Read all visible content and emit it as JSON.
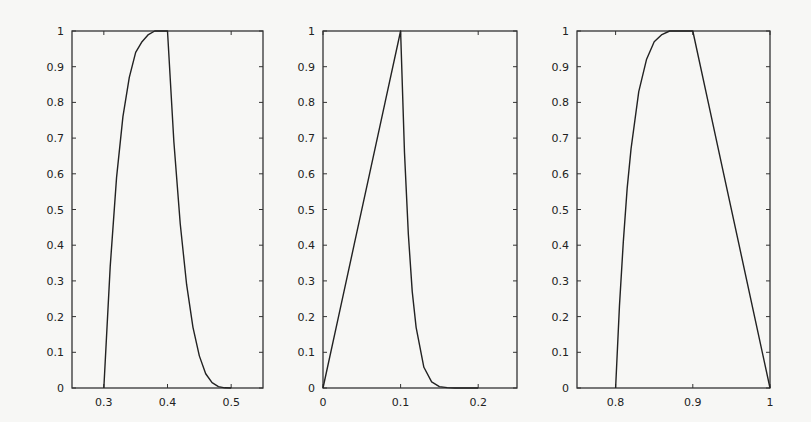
{
  "figure": {
    "panel_count": 3,
    "background": "#f7f7f5",
    "line_color": "#222222"
  },
  "chart_data": [
    {
      "type": "line",
      "title": "",
      "xlabel": "",
      "ylabel": "",
      "xlim": [
        0.25,
        0.55
      ],
      "ylim": [
        0,
        1
      ],
      "xticks": [
        0.3,
        0.4,
        0.5
      ],
      "xtick_labels": [
        "0.3",
        "0.4",
        "0.5"
      ],
      "yticks": [
        0,
        0.1,
        0.2,
        0.3,
        0.4,
        0.5,
        0.6,
        0.7,
        0.8,
        0.9,
        1
      ],
      "ytick_labels": [
        "0",
        "0.1",
        "0.2",
        "0.3",
        "0.4",
        "0.5",
        "0.6",
        "0.7",
        "0.8",
        "0.9",
        "1"
      ],
      "grid": false,
      "legend": null,
      "series": [
        {
          "name": "membership",
          "description": "concave rise from (0.3,0) to peak (0.4,1), convex decay to (0.5,0)",
          "x": [
            0.3,
            0.31,
            0.32,
            0.33,
            0.34,
            0.35,
            0.36,
            0.37,
            0.38,
            0.39,
            0.4,
            0.41,
            0.42,
            0.43,
            0.44,
            0.45,
            0.46,
            0.47,
            0.48,
            0.49,
            0.5
          ],
          "y": [
            0,
            0.34,
            0.59,
            0.76,
            0.87,
            0.94,
            0.97,
            0.99,
            1.0,
            1.0,
            1.0,
            0.69,
            0.46,
            0.29,
            0.17,
            0.09,
            0.04,
            0.015,
            0.004,
            0.0005,
            0
          ]
        }
      ]
    },
    {
      "type": "line",
      "title": "",
      "xlabel": "",
      "ylabel": "",
      "xlim": [
        0,
        0.25
      ],
      "ylim": [
        0,
        1
      ],
      "xticks": [
        0,
        0.1,
        0.2
      ],
      "xtick_labels": [
        "0",
        "0.1",
        "0.2"
      ],
      "yticks": [
        0,
        0.1,
        0.2,
        0.3,
        0.4,
        0.5,
        0.6,
        0.7,
        0.8,
        0.9,
        1
      ],
      "ytick_labels": [
        "0",
        "0.1",
        "0.2",
        "0.3",
        "0.4",
        "0.5",
        "0.6",
        "0.7",
        "0.8",
        "0.9",
        "1"
      ],
      "grid": false,
      "legend": null,
      "series": [
        {
          "name": "membership",
          "description": "linear rise from (0,0) to peak (0.1,1), steep convex decay reaching ~0 near 0.18",
          "x": [
            0,
            0.02,
            0.04,
            0.06,
            0.08,
            0.1,
            0.105,
            0.11,
            0.115,
            0.12,
            0.13,
            0.14,
            0.15,
            0.16,
            0.17,
            0.18,
            0.2
          ],
          "y": [
            0,
            0.2,
            0.4,
            0.6,
            0.8,
            1.0,
            0.66,
            0.43,
            0.27,
            0.17,
            0.058,
            0.017,
            0.004,
            0.001,
            0.0002,
            0,
            0
          ]
        }
      ]
    },
    {
      "type": "line",
      "title": "",
      "xlabel": "",
      "ylabel": "",
      "xlim": [
        0.75,
        1
      ],
      "ylim": [
        0,
        1
      ],
      "xticks": [
        0.8,
        0.9,
        1
      ],
      "xtick_labels": [
        "0.8",
        "0.9",
        "1"
      ],
      "yticks": [
        0,
        0.1,
        0.2,
        0.3,
        0.4,
        0.5,
        0.6,
        0.7,
        0.8,
        0.9,
        1
      ],
      "ytick_labels": [
        "0",
        "0.1",
        "0.2",
        "0.3",
        "0.4",
        "0.5",
        "0.6",
        "0.7",
        "0.8",
        "0.9",
        "1"
      ],
      "grid": false,
      "legend": null,
      "series": [
        {
          "name": "membership",
          "description": "steep concave rise from (0.8,0) plateauing at 1 near 0.88, linear fall from (0.9,1) to (1,0)",
          "x": [
            0.8,
            0.805,
            0.81,
            0.815,
            0.82,
            0.83,
            0.84,
            0.85,
            0.86,
            0.87,
            0.88,
            0.89,
            0.9,
            0.92,
            0.94,
            0.96,
            0.98,
            1.0
          ],
          "y": [
            0,
            0.23,
            0.41,
            0.56,
            0.67,
            0.83,
            0.92,
            0.97,
            0.99,
            1.0,
            1.0,
            1.0,
            1.0,
            0.8,
            0.6,
            0.4,
            0.2,
            0
          ]
        }
      ]
    }
  ],
  "layout": {
    "panels": [
      {
        "left": 72,
        "top": 31,
        "right": 263,
        "bottom": 388
      },
      {
        "left": 323,
        "top": 31,
        "right": 517,
        "bottom": 388
      },
      {
        "left": 577,
        "top": 31,
        "right": 770,
        "bottom": 388
      }
    ]
  }
}
